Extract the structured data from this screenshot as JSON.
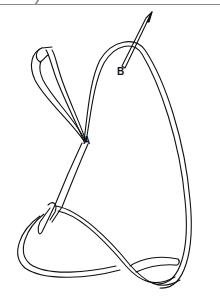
{
  "figure": {
    "type": "stitch-illustration",
    "labels": {
      "a": "A",
      "b": "B"
    },
    "colors": {
      "line": "#111111",
      "background": "#ffffff",
      "edge": "#8a8a8a"
    }
  }
}
